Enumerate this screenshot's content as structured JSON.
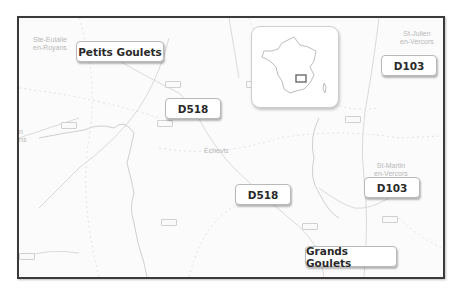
{
  "map": {
    "colors": {
      "frame_border": "#3a3a3a",
      "background": "#fbfbfb",
      "road": "#d6d6d6",
      "label_text": "#2a2a2a",
      "place_text": "#b8b8b8"
    },
    "place_names": [
      {
        "id": "ste-eulalie",
        "text": "Ste-Eulalie\nen-Royans"
      },
      {
        "id": "st-julien",
        "text": "St-Julien\nen-Vercors"
      },
      {
        "id": "st-martin",
        "text": "St-Martin\nen-Vercors"
      },
      {
        "id": "echevis",
        "text": "Échevis"
      },
      {
        "id": "left-edge",
        "text": "n\nns"
      }
    ],
    "callouts": [
      {
        "id": "petits-goulets",
        "text": "Petits Goulets"
      },
      {
        "id": "d518-upper",
        "text": "D518"
      },
      {
        "id": "d518-lower",
        "text": "D518"
      },
      {
        "id": "d103-upper",
        "text": "D103"
      },
      {
        "id": "d103-lower",
        "text": "D103"
      },
      {
        "id": "grands-goulets",
        "text": "Grands Goulets"
      }
    ],
    "inset": {
      "name": "France locator map",
      "highlight": "study area rectangle in south-east France"
    }
  }
}
